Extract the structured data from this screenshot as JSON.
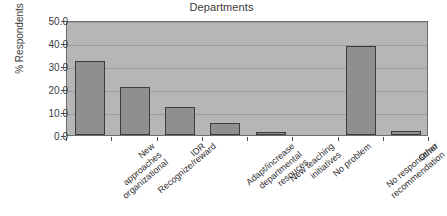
{
  "chart_data": {
    "type": "bar",
    "title": "Departments",
    "xlabel": "",
    "ylabel": "% Respondents",
    "ylim": [
      0,
      50
    ],
    "yticks": [
      "0.0",
      "10.0",
      "20.0",
      "30.0",
      "40.0",
      "50.0"
    ],
    "ytick_values": [
      0,
      10,
      20,
      30,
      40,
      50
    ],
    "grid": true,
    "legend": "none",
    "categories": [
      "New approaches organizational",
      "Recognize/reward",
      "IDR",
      "Adapt/increase departmental resouces",
      "New teaching initiatives",
      "No problem",
      "No response/no recommendation",
      "Other"
    ],
    "category_lines": [
      [
        "New",
        "approaches",
        "organizational"
      ],
      [
        "Recognize/reward"
      ],
      [
        "IDR"
      ],
      [
        "Adapt/increase",
        "departmental",
        "resouces"
      ],
      [
        "New teaching",
        "initiatives"
      ],
      [
        "No problem"
      ],
      [
        "No response/no",
        "recommendation"
      ],
      [
        "Other"
      ]
    ],
    "values": [
      32.2,
      20.9,
      12.2,
      5.2,
      1.1,
      0,
      38.8,
      1.6
    ],
    "colors": {
      "bar_fill": "#8f8f8f",
      "bar_border": "#3c3c3c",
      "plot_background": "#b6b6b6",
      "gridline": "#9d9d9d",
      "axis": "#6d6d6d",
      "text": "#2e2e2e",
      "page_background": "#ffffff"
    }
  }
}
